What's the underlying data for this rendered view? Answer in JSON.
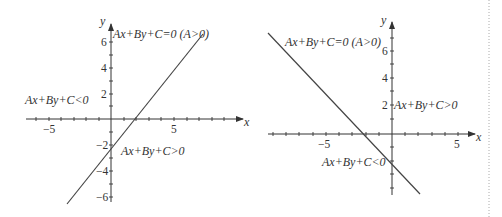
{
  "figures": [
    {
      "id": "left",
      "axes": {
        "x_label": "x",
        "y_label": "y",
        "x_ticks": [
          "−5",
          "5"
        ],
        "y_ticks": [
          "6",
          "4",
          "2",
          "−2",
          "−4",
          "−6"
        ]
      },
      "line_label": "Ax+By+C=0 (A>0)",
      "region_left": "Ax+By+C<0",
      "region_right": "Ax+By+C>0",
      "slope": "positive"
    },
    {
      "id": "right",
      "axes": {
        "x_label": "x",
        "y_label": "y",
        "x_ticks": [
          "−5",
          "5"
        ],
        "y_ticks": [
          "6",
          "4",
          "2"
        ]
      },
      "line_label": "Ax+By+C=0 (A>0)",
      "region_upper_right": "Ax+By+C>0",
      "region_lower_left": "Ax+By+C<0",
      "slope": "negative"
    }
  ]
}
